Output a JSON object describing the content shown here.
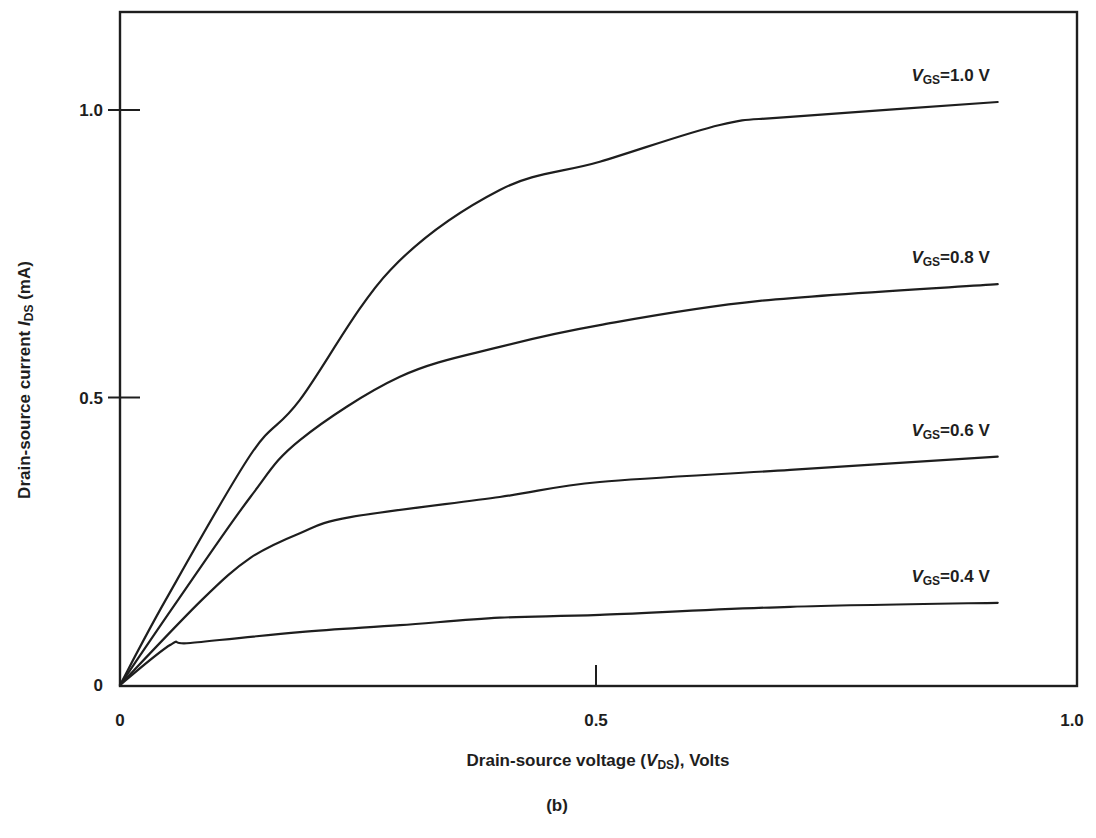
{
  "chart_data": {
    "type": "line",
    "title": "",
    "caption": "(b)",
    "xlabel": {
      "prefix": "Drain-source voltage (",
      "var": "V",
      "sub": "DS",
      "suffix": "), Volts"
    },
    "ylabel": {
      "prefix": "Drain-source current ",
      "var": "I",
      "sub": "DS",
      "suffix": " (mA)"
    },
    "xlim": [
      0,
      1.0
    ],
    "ylim": [
      0,
      1.2
    ],
    "xticks": [
      {
        "value": 0,
        "label": "0"
      },
      {
        "value": 0.5,
        "label": "0.5"
      },
      {
        "value": 1.0,
        "label": "1.0"
      }
    ],
    "yticks": [
      {
        "value": 0,
        "label": "0"
      },
      {
        "value": 0.5,
        "label": "0.5"
      },
      {
        "value": 1.0,
        "label": "1.0"
      }
    ],
    "grid": false,
    "legend": "inline labels at right end of each curve",
    "series": [
      {
        "name": "VGS=1.0 V",
        "label": {
          "var": "V",
          "sub": "GS",
          "text": "=1.0 V"
        },
        "x": [
          0,
          0.048,
          0.137,
          0.189,
          0.284,
          0.399,
          0.504,
          0.63,
          0.704,
          0.922
        ],
        "y": [
          0,
          0.148,
          0.4,
          0.496,
          0.722,
          0.861,
          0.91,
          0.974,
          0.988,
          1.014
        ]
      },
      {
        "name": "VGS=0.8 V",
        "label": {
          "var": "V",
          "sub": "GS",
          "text": "=0.8 V"
        },
        "x": [
          0,
          0.061,
          0.137,
          0.189,
          0.294,
          0.399,
          0.504,
          0.672,
          0.922
        ],
        "y": [
          0,
          0.148,
          0.327,
          0.426,
          0.536,
          0.588,
          0.626,
          0.668,
          0.697
        ]
      },
      {
        "name": "VGS=0.6 V",
        "label": {
          "var": "V",
          "sub": "GS",
          "text": "=0.6 V"
        },
        "x": [
          0,
          0.086,
          0.137,
          0.189,
          0.242,
          0.399,
          0.504,
          0.704,
          0.922
        ],
        "y": [
          0,
          0.148,
          0.221,
          0.264,
          0.292,
          0.327,
          0.353,
          0.374,
          0.397
        ]
      },
      {
        "name": "VGS=0.4 V",
        "label": {
          "var": "V",
          "sub": "GS",
          "text": "=0.4 V"
        },
        "x": [
          0,
          0.053,
          0.074,
          0.189,
          0.294,
          0.399,
          0.504,
          0.704,
          0.922
        ],
        "y": [
          0,
          0.07,
          0.073,
          0.092,
          0.104,
          0.117,
          0.122,
          0.136,
          0.143
        ]
      }
    ]
  }
}
